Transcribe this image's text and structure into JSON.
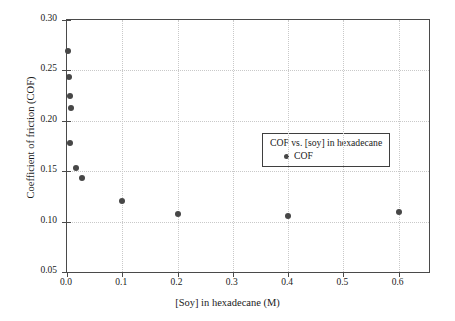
{
  "chart_data": {
    "type": "scatter",
    "title": "",
    "xlabel": "[Soy] in hexadecane (M)",
    "ylabel": "Coefficient of friction (COF)",
    "xlim": [
      0.0,
      0.655
    ],
    "ylim": [
      0.05,
      0.3
    ],
    "grid": true,
    "legend_position": "center",
    "legend_title": "COF vs. [soy] in hexadecane",
    "xticks": [
      "0.0",
      "0.1",
      "0.2",
      "0.3",
      "0.4",
      "0.5",
      "0.6"
    ],
    "xtick_values": [
      0.0,
      0.1,
      0.2,
      0.3,
      0.4,
      0.5,
      0.6
    ],
    "yticks": [
      "0.30",
      "0.25",
      "0.20",
      "0.15",
      "0.10",
      "0.05"
    ],
    "ytick_values": [
      0.3,
      0.25,
      0.2,
      0.15,
      0.1,
      0.05
    ],
    "series": [
      {
        "name": "COF",
        "marker": "circle",
        "color": "#474747",
        "x": [
          0.002,
          0.004,
          0.006,
          0.008,
          0.006,
          0.016,
          0.028,
          0.1,
          0.2,
          0.4,
          0.6
        ],
        "y": [
          0.269,
          0.243,
          0.225,
          0.213,
          0.178,
          0.153,
          0.143,
          0.12,
          0.108,
          0.106,
          0.11
        ]
      }
    ]
  },
  "legend": {
    "title": "COF vs. [soy] in hexadecane",
    "entries": [
      {
        "label": "COF"
      }
    ]
  },
  "axes": {
    "x_title": "[Soy] in hexadecane (M)",
    "y_title": "Coefficient of friction (COF)"
  }
}
